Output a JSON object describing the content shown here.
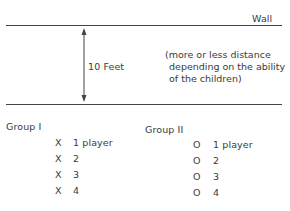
{
  "wall_label": "Wall",
  "distance_label": "10 Feet",
  "note": {
    "line1": "(more or less distance",
    "line2": "depending on the ability",
    "line3": "of the children)"
  },
  "groups": [
    {
      "title": "Group I",
      "marker": "X",
      "rows": [
        "1 player",
        "2",
        "3",
        "4"
      ]
    },
    {
      "title": "Group II",
      "marker": "O",
      "rows": [
        "1 player",
        "2",
        "3",
        "4"
      ]
    }
  ],
  "colors": {
    "ink": "#3a3a3a",
    "line": "#444444",
    "background": "#ffffff"
  }
}
